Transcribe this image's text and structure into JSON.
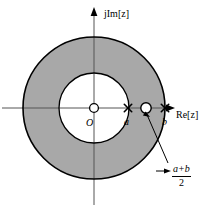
{
  "figure": {
    "kind": "complex-plane-roc-diagram",
    "background": "#ffffff",
    "shade_color": "#a8a8a8",
    "stroke_color": "#000000"
  },
  "axes": {
    "vertical_label": "jIm[z]",
    "horizontal_label": "Re[z]",
    "origin_label": "O"
  },
  "markers": {
    "inner_pole_label": "a",
    "outer_pole_label": "b",
    "midpoint_label_numerator": "a+b",
    "midpoint_label_denominator": "2",
    "midpoint_numerator_a": "a",
    "midpoint_numerator_op": "+",
    "midpoint_numerator_b": "b"
  },
  "geometry": {
    "origin_x": 94,
    "origin_y": 108,
    "outer_radius": 71,
    "inner_radius": 35,
    "pole_a_x": 128,
    "pole_b_x": 165,
    "zero_mid_x": 146
  }
}
